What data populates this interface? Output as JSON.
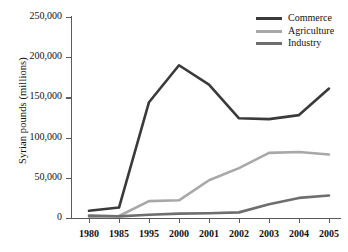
{
  "chart_data": {
    "type": "line",
    "title": "",
    "xlabel": "",
    "ylabel": "Syrian pounds (millions)",
    "categories": [
      "1980",
      "1985",
      "1995",
      "2000",
      "2001",
      "2002",
      "2003",
      "2004",
      "2005"
    ],
    "ylim": [
      0,
      250000
    ],
    "ytick_values": [
      0,
      50000,
      100000,
      150000,
      200000,
      250000
    ],
    "ytick_labels": [
      "0",
      "50,000",
      "100,000",
      "150,000",
      "200,000",
      "250,000"
    ],
    "grid": false,
    "legend_position": "top-right",
    "series": [
      {
        "name": "Commerce",
        "color": "#3a3a3a",
        "values": [
          9000,
          13000,
          144000,
          190000,
          166000,
          124000,
          123000,
          128000,
          161000
        ]
      },
      {
        "name": "Agriculture",
        "color": "#a8a8a8",
        "values": [
          1500,
          2500,
          21000,
          22000,
          47000,
          62000,
          81000,
          82000,
          79000
        ]
      },
      {
        "name": "Industry",
        "color": "#6e6e6e",
        "values": [
          3000,
          2000,
          4000,
          5500,
          6000,
          7000,
          17000,
          25000,
          28000
        ]
      }
    ]
  },
  "axis": {
    "y_title": "Syrian pounds (millions)"
  },
  "legend": {
    "items": [
      {
        "label": "Commerce"
      },
      {
        "label": "Agriculture"
      },
      {
        "label": "Industry"
      }
    ]
  }
}
